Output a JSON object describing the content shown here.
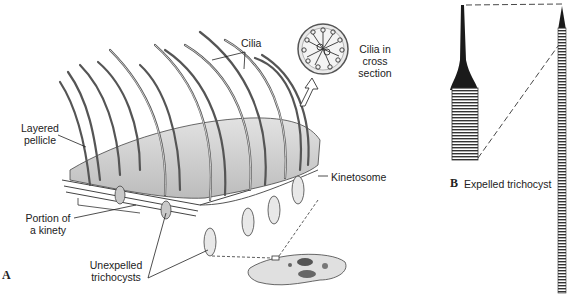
{
  "figure": {
    "panel_a": {
      "letter": "A",
      "labels": {
        "cilia": "Cilia",
        "cross_section_1": "Cilia in",
        "cross_section_2": "cross",
        "cross_section_3": "section",
        "layered_pellicle_1": "Layered",
        "layered_pellicle_2": "pellicle",
        "kinetosome": "Kinetosome",
        "kinety_1": "Portion of",
        "kinety_2": "a kinety",
        "unexpelled_1": "Unexpelled",
        "unexpelled_2": "trichocysts"
      }
    },
    "panel_b": {
      "letter": "B",
      "caption": "Expelled trichocyst"
    },
    "colors": {
      "line": "#333333",
      "fill_light": "#d9d9d9",
      "fill_mid": "#bdbdbd",
      "dark": "#1a1a1a"
    }
  }
}
